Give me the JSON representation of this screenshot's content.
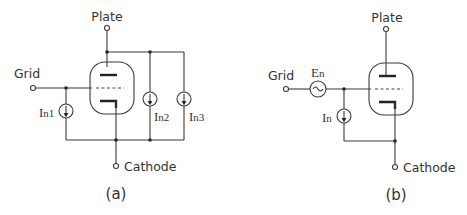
{
  "figure_a": {
    "caption": "(a)",
    "plate_label": "Plate",
    "grid_label": "Grid",
    "cathode_label": "Cathode",
    "sources": [
      {
        "label": "In1",
        "main": "I",
        "sub": "n1"
      },
      {
        "label": "In2",
        "main": "I",
        "sub": "n2"
      },
      {
        "label": "In3",
        "main": "I",
        "sub": "n3"
      }
    ]
  },
  "figure_b": {
    "caption": "(b)",
    "plate_label": "Plate",
    "grid_label": "Grid",
    "cathode_label": "Cathode",
    "voltage_source": {
      "label": "En",
      "main": "E",
      "sub": "n"
    },
    "current_source": {
      "label": "In",
      "main": "I",
      "sub": "n"
    }
  },
  "colors": {
    "line": "#3a3a3a",
    "text": "#333333",
    "background": "#ffffff"
  }
}
